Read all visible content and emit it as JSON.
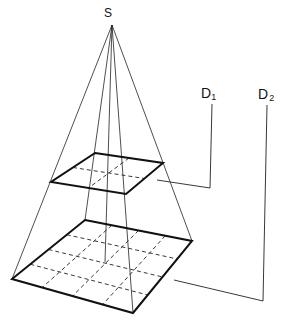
{
  "diagram": {
    "type": "projection-pyramid",
    "labels": {
      "apex": "S",
      "d1_main": "D",
      "d1_sub": "1",
      "d2_main": "D",
      "d2_sub": "2"
    },
    "apex": [
      112,
      25
    ],
    "plane_upper": {
      "corners": [
        [
          95,
          153
        ],
        [
          163,
          163
        ],
        [
          126,
          194
        ],
        [
          51,
          182
        ]
      ],
      "grid": 2
    },
    "plane_lower": {
      "corners": [
        [
          85,
          220
        ],
        [
          192,
          241
        ],
        [
          133,
          313
        ],
        [
          12,
          279
        ]
      ],
      "grid": 4
    },
    "colors": {
      "stroke": "#111111",
      "background": "#ffffff"
    }
  }
}
